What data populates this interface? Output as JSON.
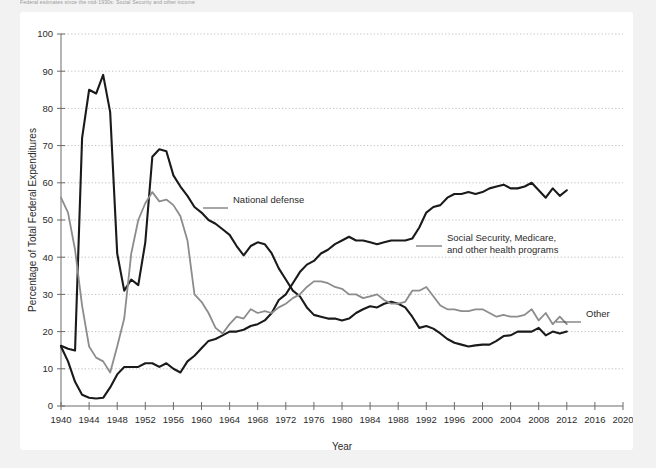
{
  "caption": {
    "text": "Federal estimates since the mid-1930s: Social Security and other income"
  },
  "colors": {
    "card_bg": "#ffffff",
    "page_bg": "#f2f2f2",
    "series_dark": "#1a1a1a",
    "series_gray": "#8c8c8c",
    "axis": "#6b6b6b",
    "grid": "#b8b8b8",
    "text": "#2b2b2b"
  },
  "chart_data": {
    "type": "line",
    "title": "",
    "xlabel": "Year",
    "ylabel": "Percentage of Total Federal Expenditures",
    "xlim": [
      1940,
      2020
    ],
    "ylim": [
      0,
      100
    ],
    "xticks": [
      1940,
      1944,
      1948,
      1952,
      1956,
      1960,
      1964,
      1968,
      1972,
      1976,
      1980,
      1984,
      1988,
      1992,
      1996,
      2000,
      2004,
      2008,
      2012,
      2016,
      2020
    ],
    "yticks": [
      0,
      10,
      20,
      30,
      40,
      50,
      60,
      70,
      80,
      90,
      100
    ],
    "grid": "horizontal-dotted",
    "legend": "inline-annotations",
    "x": [
      1940,
      1941,
      1942,
      1943,
      1944,
      1945,
      1946,
      1947,
      1948,
      1949,
      1950,
      1951,
      1952,
      1953,
      1954,
      1955,
      1956,
      1957,
      1958,
      1959,
      1960,
      1961,
      1962,
      1963,
      1964,
      1965,
      1966,
      1967,
      1968,
      1969,
      1970,
      1971,
      1972,
      1973,
      1974,
      1975,
      1976,
      1977,
      1978,
      1979,
      1980,
      1981,
      1982,
      1983,
      1984,
      1985,
      1986,
      1987,
      1988,
      1989,
      1990,
      1991,
      1992,
      1993,
      1994,
      1995,
      1996,
      1997,
      1998,
      1999,
      2000,
      2001,
      2002,
      2003,
      2004,
      2005,
      2006,
      2007,
      2008,
      2009,
      2010,
      2011,
      2012
    ],
    "series": [
      {
        "name": "National defense",
        "color": "#1a1a1a",
        "label_x": 1966,
        "label_y": 55,
        "values": [
          16.2,
          15.4,
          14.9,
          72.0,
          85.0,
          84.0,
          89.0,
          79.0,
          41.0,
          31.0,
          34.0,
          32.5,
          44.0,
          67.0,
          69.0,
          68.5,
          62.0,
          59.0,
          56.5,
          53.5,
          52.0,
          50.0,
          49.0,
          47.5,
          46.0,
          43.0,
          40.5,
          43.0,
          44.0,
          43.5,
          41.0,
          37.0,
          34.0,
          31.0,
          29.5,
          26.5,
          24.5,
          24.0,
          23.5,
          23.5,
          23.0,
          23.5,
          25.0,
          26.0,
          26.8,
          26.5,
          27.5,
          28.0,
          27.5,
          26.5,
          24.0,
          21.0,
          21.5,
          20.8,
          19.5,
          18.0,
          17.0,
          16.5,
          16.0,
          16.3,
          16.5,
          16.5,
          17.5,
          18.8,
          19.0,
          20.0,
          20.0,
          20.0,
          21.0,
          19.0,
          20.0,
          19.5,
          20.0
        ]
      },
      {
        "name": "Social Security, Medicare, and other health programs",
        "color": "#1a1a1a",
        "label_x": 1992,
        "label_y": 46,
        "values": [
          16.0,
          12.0,
          6.5,
          3.0,
          2.2,
          2.0,
          2.2,
          5.0,
          8.5,
          10.5,
          10.5,
          10.5,
          11.5,
          11.5,
          10.5,
          11.5,
          10.0,
          9.0,
          12.0,
          13.5,
          15.5,
          17.5,
          18.0,
          19.0,
          20.0,
          20.0,
          20.5,
          21.5,
          22.0,
          23.0,
          25.0,
          28.5,
          30.0,
          33.0,
          36.0,
          38.0,
          39.0,
          41.0,
          42.0,
          43.5,
          44.5,
          45.5,
          44.5,
          44.5,
          44.0,
          43.5,
          44.0,
          44.5,
          44.5,
          44.5,
          45.0,
          48.0,
          52.0,
          53.5,
          54.0,
          56.0,
          57.0,
          57.0,
          57.5,
          57.0,
          57.5,
          58.5,
          59.0,
          59.5,
          58.5,
          58.5,
          59.0,
          60.0,
          58.0,
          56.0,
          58.5,
          56.5,
          58.0
        ]
      },
      {
        "name": "Other",
        "color": "#8c8c8c",
        "label_x": 2014,
        "label_y": 24,
        "values": [
          56.0,
          52.0,
          42.0,
          27.0,
          16.0,
          13.0,
          12.0,
          9.0,
          16.0,
          23.5,
          41.0,
          50.0,
          54.5,
          57.5,
          55.0,
          55.5,
          54.0,
          51.0,
          44.5,
          30.0,
          28.0,
          25.0,
          21.0,
          19.5,
          22.0,
          24.0,
          23.5,
          26.0,
          25.0,
          25.5,
          25.0,
          26.5,
          27.5,
          29.0,
          30.0,
          32.0,
          33.5,
          33.5,
          33.0,
          32.0,
          31.5,
          30.0,
          30.0,
          29.0,
          29.5,
          30.0,
          28.5,
          27.5,
          27.5,
          28.0,
          31.0,
          31.0,
          32.0,
          29.5,
          27.0,
          26.0,
          26.0,
          25.5,
          25.5,
          26.0,
          26.0,
          25.0,
          24.0,
          24.5,
          24.0,
          24.0,
          24.5,
          26.0,
          23.0,
          25.0,
          22.0,
          24.0,
          22.0
        ]
      }
    ]
  }
}
